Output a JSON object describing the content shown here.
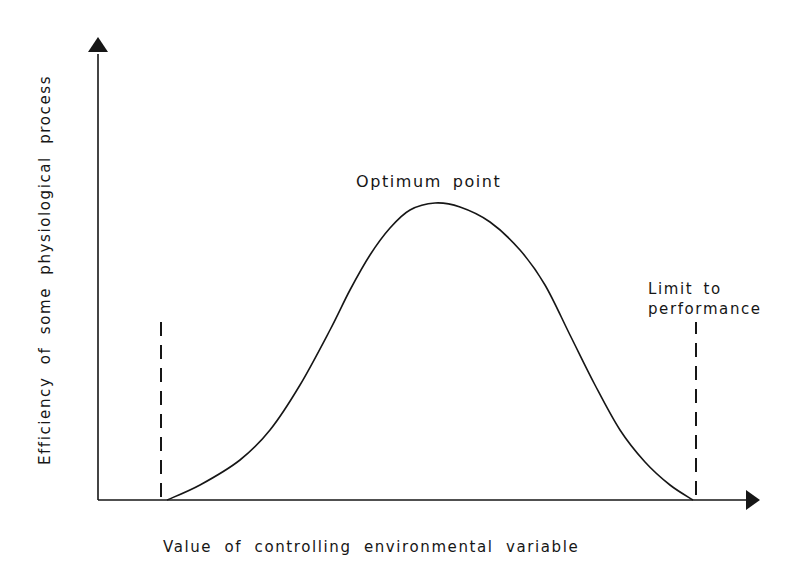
{
  "chart_data": {
    "type": "line",
    "title": "",
    "xlabel": "Value of controlling environmental variable",
    "ylabel": "Efficiency of some physiological process",
    "grid": false,
    "legend": null,
    "annotations": [
      {
        "text": "Optimum point",
        "position": "above curve peak"
      },
      {
        "text": "Limit to performance",
        "position": "above right dashed limit line"
      }
    ],
    "limit_lines": [
      {
        "side": "lower",
        "style": "dashed",
        "x_px": 161
      },
      {
        "side": "upper",
        "style": "dashed",
        "x_px": 696
      }
    ],
    "series": [
      {
        "name": "Performance curve",
        "shape": "bell-shaped",
        "x_px": [
          167,
          200,
          240,
          270,
          300,
          330,
          350,
          370,
          390,
          410,
          435,
          460,
          490,
          520,
          545,
          570,
          595,
          620,
          645,
          670,
          693
        ],
        "y_px": [
          500,
          485,
          460,
          430,
          385,
          330,
          290,
          255,
          228,
          210,
          203,
          207,
          222,
          250,
          285,
          335,
          385,
          430,
          462,
          485,
          500
        ],
        "values_relative": [
          0,
          0.05,
          0.14,
          0.24,
          0.4,
          0.57,
          0.71,
          0.83,
          0.92,
          0.98,
          1.0,
          0.99,
          0.94,
          0.84,
          0.72,
          0.56,
          0.39,
          0.24,
          0.13,
          0.05,
          0
        ]
      }
    ]
  },
  "labels": {
    "y_axis": "Efficiency of some physiological process",
    "x_axis": "Value of controlling environmental variable",
    "optimum": "Optimum point",
    "limit_line1": "Limit to",
    "limit_line2": "performance"
  },
  "colors": {
    "ink": "#161616",
    "background": "#ffffff"
  }
}
